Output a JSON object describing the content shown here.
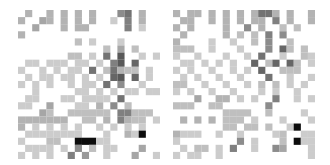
{
  "chart_data": [
    {
      "type": "heatmap",
      "title": "",
      "xlabel": "",
      "ylabel": "",
      "grid": false,
      "colormap": "grayscale (white = 0, black = 1)",
      "rows": 21,
      "cols": 20,
      "cells": [
        [
          0,
          0.3,
          0,
          0,
          0.3,
          0,
          0.3,
          0,
          0.3,
          0,
          0.3,
          0,
          0,
          0,
          0.45,
          0.55,
          0,
          0.3,
          0,
          0
        ],
        [
          0.3,
          0,
          0,
          0.35,
          0.3,
          0,
          0.3,
          0,
          0.3,
          0,
          0.3,
          0,
          0,
          0.2,
          0,
          0.5,
          0,
          0.3,
          0,
          0
        ],
        [
          0,
          0,
          0.35,
          0,
          0,
          0,
          0.3,
          0,
          0.3,
          0.3,
          0,
          0,
          0,
          0,
          0,
          0.5,
          0,
          0.2,
          0,
          0
        ],
        [
          0.3,
          0,
          0,
          0,
          0,
          0,
          0,
          0,
          0,
          0,
          0,
          0,
          0,
          0,
          0,
          0,
          0,
          0,
          0,
          0
        ],
        [
          0,
          0,
          0,
          0,
          0,
          0,
          0,
          0,
          0.25,
          0,
          0.2,
          0,
          0,
          0,
          0.2,
          0,
          0,
          0,
          0,
          0
        ],
        [
          0,
          0,
          0,
          0,
          0,
          0,
          0,
          0,
          0,
          0,
          0,
          0,
          0.25,
          0,
          0.35,
          0,
          0.25,
          0,
          0,
          0
        ],
        [
          0,
          0,
          0,
          0,
          0,
          0,
          0,
          0.25,
          0.25,
          0,
          0.2,
          0,
          0.55,
          0,
          0.65,
          0,
          0,
          0.2,
          0,
          0.2
        ],
        [
          0,
          0.2,
          0.2,
          0,
          0.2,
          0.2,
          0.2,
          0,
          0.2,
          0.2,
          0,
          0.2,
          0,
          0.5,
          0.65,
          0,
          0.6,
          0,
          0,
          0
        ],
        [
          0.2,
          0,
          0,
          0.2,
          0,
          0.2,
          0,
          0.2,
          0.2,
          0,
          0.55,
          0,
          0.25,
          0.55,
          0.3,
          0.25,
          0.25,
          0,
          0.2,
          0
        ],
        [
          0,
          0.2,
          0,
          0.2,
          0.2,
          0,
          0.2,
          0.2,
          0,
          0.2,
          0,
          0.2,
          0,
          0.6,
          0.65,
          0,
          0.6,
          0,
          0.2,
          0
        ],
        [
          0.2,
          0,
          0.2,
          0,
          0.2,
          0,
          0,
          0.2,
          0,
          0.2,
          0.2,
          0,
          0.55,
          0,
          0.45,
          0,
          0,
          0.2,
          0,
          0
        ],
        [
          0,
          0,
          0.2,
          0,
          0,
          0,
          0,
          0,
          0.2,
          0.2,
          0,
          0.2,
          0,
          0.2,
          0,
          0.2,
          0.2,
          0,
          0.2,
          0.2
        ],
        [
          0,
          0.2,
          0.2,
          0,
          0,
          0,
          0.2,
          0.2,
          0,
          0.2,
          0.2,
          0.2,
          0.2,
          0,
          0.55,
          0,
          0,
          0,
          0,
          0
        ],
        [
          0.2,
          0.2,
          0,
          0,
          0.35,
          0,
          0,
          0,
          0.2,
          0.2,
          0,
          0.3,
          0,
          0.45,
          0,
          0.25,
          0,
          0,
          0,
          0
        ],
        [
          0,
          0,
          0,
          0.35,
          0.25,
          0,
          0,
          0.25,
          0.25,
          0.25,
          0.25,
          0.25,
          0.25,
          0,
          0.5,
          0.5,
          0.25,
          0.25,
          0.25,
          0
        ],
        [
          0.3,
          0.3,
          0.3,
          0.3,
          0.3,
          0.3,
          0.3,
          0,
          0,
          0.25,
          0.25,
          0,
          0.3,
          0,
          0.5,
          0.3,
          0.25,
          0.25,
          0,
          0.2
        ],
        [
          0.3,
          0,
          0.2,
          0,
          0.2,
          0,
          0.2,
          0,
          0.2,
          0,
          0,
          0.2,
          0,
          0.2,
          0,
          0.2,
          0,
          0.2,
          0,
          0
        ],
        [
          0,
          0.2,
          0.2,
          0.2,
          0.2,
          0.2,
          0.2,
          0.2,
          0.2,
          0,
          0,
          0,
          0.2,
          0,
          0,
          0.3,
          0.2,
          0.95,
          0,
          0
        ],
        [
          0.2,
          0,
          0,
          0,
          0.25,
          0.25,
          0,
          0,
          0.95,
          0.95,
          0.95,
          0.2,
          0.2,
          0,
          0,
          0,
          0,
          0,
          0,
          0
        ],
        [
          0,
          0.2,
          0.2,
          0.2,
          0.2,
          0,
          0.2,
          0,
          0.45,
          0,
          0.25,
          0,
          0.2,
          0.2,
          0,
          0,
          0,
          0.35,
          0,
          0
        ],
        [
          0.2,
          0,
          0.2,
          0,
          0.2,
          0,
          0,
          0.5,
          0,
          0.4,
          0,
          0,
          0.2,
          0,
          0,
          0,
          0.35,
          0,
          0,
          0.2
        ]
      ]
    },
    {
      "type": "heatmap",
      "title": "",
      "xlabel": "",
      "ylabel": "",
      "grid": false,
      "colormap": "grayscale (white = 0, black = 1)",
      "rows": 21,
      "cols": 20,
      "cells": [
        [
          0.3,
          0,
          0.3,
          0.3,
          0,
          0.3,
          0,
          0.3,
          0,
          0.3,
          0,
          0.3,
          0.55,
          0.55,
          0.3,
          0,
          0.3,
          0,
          0,
          0.3
        ],
        [
          0,
          0.3,
          0.3,
          0,
          0,
          0.3,
          0,
          0.3,
          0,
          0.3,
          0,
          0.3,
          0.3,
          0,
          0.5,
          0,
          0.3,
          0,
          0,
          0.3
        ],
        [
          0.3,
          0,
          0.3,
          0,
          0,
          0,
          0,
          0.3,
          0,
          0,
          0.45,
          0,
          0.3,
          0,
          0,
          0.25,
          0,
          0.25,
          0,
          0
        ],
        [
          0,
          0.3,
          0,
          0,
          0,
          0,
          0,
          0.3,
          0,
          0.25,
          0,
          0.25,
          0,
          0.5,
          0,
          0.45,
          0,
          0,
          0,
          0
        ],
        [
          0.3,
          0,
          0,
          0,
          0,
          0.2,
          0,
          0,
          0.2,
          0,
          0,
          0.25,
          0,
          0.45,
          0,
          0,
          0.25,
          0,
          0,
          0
        ],
        [
          0.25,
          0.25,
          0.25,
          0,
          0,
          0.2,
          0,
          0,
          0,
          0.2,
          0,
          0,
          0,
          0.45,
          0,
          0.6,
          0.25,
          0,
          0.25,
          0
        ],
        [
          0.2,
          0,
          0,
          0.2,
          0,
          0,
          0,
          0.2,
          0,
          0,
          0.2,
          0,
          0.55,
          0,
          0,
          0.2,
          0,
          0,
          0.25,
          0.2
        ],
        [
          0,
          0.2,
          0.2,
          0,
          0.2,
          0,
          0.2,
          0,
          0.2,
          0,
          0,
          0.6,
          0,
          0.25,
          0.6,
          0,
          0.6,
          0.25,
          0,
          0.2
        ],
        [
          0.2,
          0,
          0.2,
          0,
          0,
          0.2,
          0,
          0,
          0.2,
          0,
          0.2,
          0,
          0.6,
          0,
          0,
          0.25,
          0.25,
          0.25,
          0,
          0
        ],
        [
          0,
          0.2,
          0,
          0.2,
          0,
          0,
          0.2,
          0,
          0,
          0.2,
          0,
          0,
          0,
          0.55,
          0,
          0,
          0.2,
          0,
          0,
          0.2
        ],
        [
          0.25,
          0.25,
          0,
          0,
          0.2,
          0,
          0,
          0.2,
          0,
          0,
          0.2,
          0,
          0.25,
          0,
          0.25,
          0,
          0.2,
          0,
          0.2,
          0
        ],
        [
          0.2,
          0,
          0.2,
          0,
          0,
          0.2,
          0,
          0,
          0.2,
          0,
          0,
          0,
          0.2,
          0,
          0.2,
          0,
          0,
          0.2,
          0,
          0
        ],
        [
          0,
          0,
          0,
          0.35,
          0,
          0,
          0.3,
          0.3,
          0,
          0.2,
          0,
          0.2,
          0,
          0,
          0.5,
          0,
          0,
          0.2,
          0,
          0.2
        ],
        [
          0.25,
          0.25,
          0.25,
          0,
          0,
          0.25,
          0.25,
          0,
          0,
          0,
          0,
          0,
          0,
          0.45,
          0,
          0,
          0,
          0,
          0,
          0
        ],
        [
          0,
          0,
          0,
          0,
          0,
          0,
          0,
          0.25,
          0.25,
          0.25,
          0.25,
          0,
          0,
          0.25,
          0,
          0,
          0,
          0,
          0.2,
          0
        ],
        [
          0,
          0.3,
          0,
          0.3,
          0,
          0.3,
          0,
          0.25,
          0.25,
          0.25,
          0,
          0.2,
          0,
          0,
          0,
          0.2,
          0,
          0,
          0,
          0.2
        ],
        [
          0,
          0,
          0,
          0,
          0,
          0,
          0,
          0.25,
          0.25,
          0,
          0.25,
          0.25,
          0,
          0.25,
          0,
          0,
          0.2,
          0.95,
          0,
          0
        ],
        [
          0.3,
          0.2,
          0.2,
          0.2,
          0,
          0,
          0.2,
          0,
          0,
          0.2,
          0,
          0,
          0,
          0,
          0.2,
          0.25,
          0,
          0,
          0.2,
          0.2
        ],
        [
          0.2,
          0,
          0,
          0,
          0,
          0,
          0,
          0,
          0,
          0.45,
          0,
          0.2,
          0,
          0,
          0,
          0.25,
          0,
          0.95,
          0.2,
          0.2
        ],
        [
          0,
          0.2,
          0,
          0.25,
          0.25,
          0,
          0.2,
          0,
          0.5,
          0,
          0,
          0.2,
          0,
          0,
          0.45,
          0.35,
          0,
          0,
          0,
          0.2
        ],
        [
          0.2,
          0,
          0.2,
          0.2,
          0,
          0,
          0.2,
          0,
          0,
          0,
          0,
          0,
          0,
          0,
          0,
          0,
          0,
          0,
          0,
          0.2
        ]
      ]
    }
  ],
  "panels": [
    {
      "label": ""
    },
    {
      "label": ""
    }
  ],
  "colors": {
    "background": "#ffffff",
    "cell_max": "#000000",
    "cell_min": "#ffffff"
  }
}
